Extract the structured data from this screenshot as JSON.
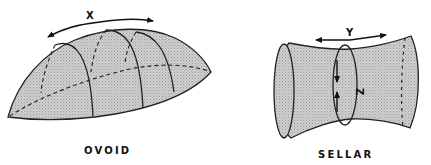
{
  "figure": {
    "colors": {
      "fill": "#c4c4c4",
      "stroke": "#222222",
      "background": "#ffffff"
    },
    "shapes": [
      {
        "id": "ovoid",
        "caption": "OVOID",
        "axis_label": "X"
      },
      {
        "id": "sellar",
        "caption": "SELLAR",
        "axis_label_horizontal": "Y",
        "axis_label_vertical": "Z"
      }
    ]
  }
}
